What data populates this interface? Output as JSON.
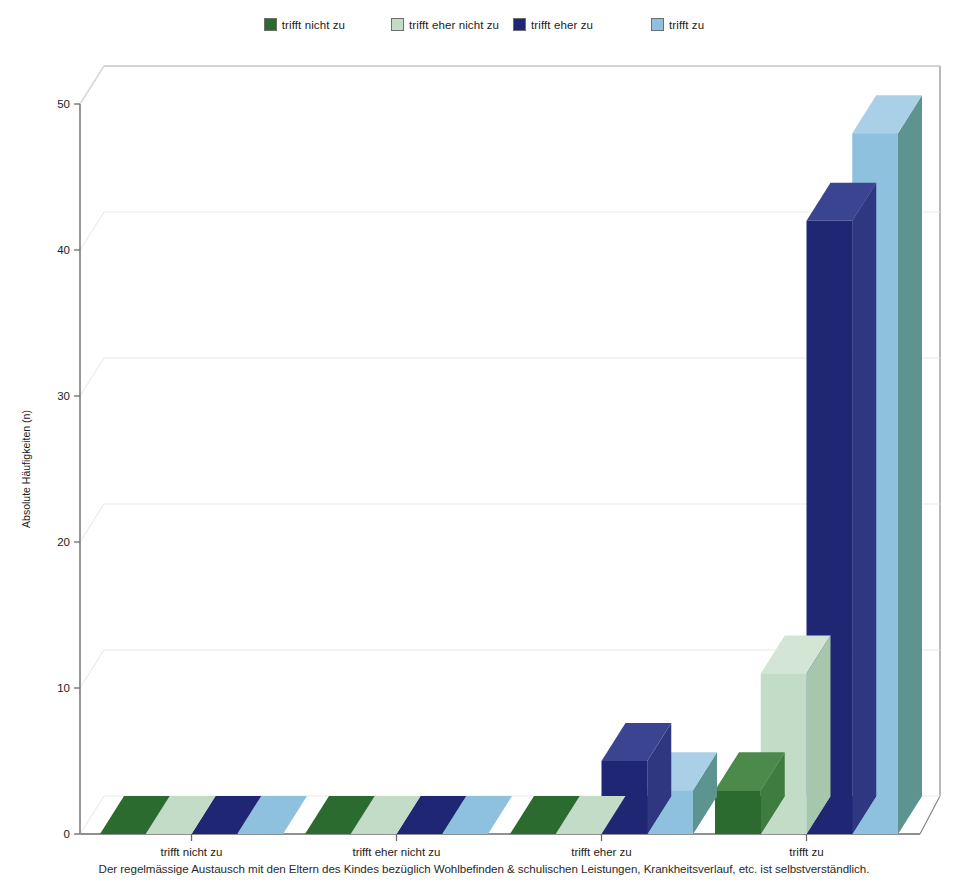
{
  "legend": {
    "items": [
      {
        "label": "trifft nicht zu",
        "color": "#2c6b2f"
      },
      {
        "label": "trifft eher nicht zu",
        "color": "#c3dcc7"
      },
      {
        "label": "trifft eher zu",
        "color": "#1f2673"
      },
      {
        "label": "trifft zu",
        "color": "#8ec1de"
      }
    ]
  },
  "axes": {
    "y_label": "Absolute Häufigkeiten (n)",
    "y_ticks": [
      "0",
      "10",
      "20",
      "30",
      "40",
      "50"
    ]
  },
  "caption": "Der regelmässige Austausch mit den Eltern des Kindes bezüglich Wohlbefinden & schulischen Leistungen, Krankheitsverlauf, etc. ist selbstverständlich.",
  "chart_data": {
    "type": "bar",
    "title": "",
    "subtitle": "",
    "xlabel": "",
    "ylabel": "Absolute Häufigkeiten (n)",
    "ylim": [
      0,
      50
    ],
    "yticks": [
      0,
      10,
      20,
      30,
      40,
      50
    ],
    "grid": true,
    "three_d": true,
    "legend_position": "top-center",
    "categories": [
      "trifft nicht zu",
      "trifft eher nicht zu",
      "trifft eher zu",
      "trifft zu"
    ],
    "series": [
      {
        "name": "trifft nicht zu",
        "color": "#2c6b2f",
        "side_color": "#3e7c3f",
        "top_color": "#4c8a4b",
        "values": [
          0,
          0,
          0,
          3
        ]
      },
      {
        "name": "trifft eher nicht zu",
        "color": "#c3dcc7",
        "side_color": "#a6c7ab",
        "top_color": "#d3e6d6",
        "values": [
          0,
          0,
          0,
          11
        ]
      },
      {
        "name": "trifft eher zu",
        "color": "#1f2673",
        "side_color": "#2f3780",
        "top_color": "#3b4490",
        "values": [
          0,
          0,
          5,
          42
        ]
      },
      {
        "name": "trifft zu",
        "color": "#8ec1de",
        "side_color": "#5d9490",
        "top_color": "#a9d0e6",
        "values": [
          0,
          0,
          3,
          48
        ]
      }
    ],
    "annotations": [
      "Der regelmässige Austausch mit den Eltern des Kindes bezüglich Wohlbefinden & schulischen Leistungen, Krankheitsverlauf, etc. ist selbstverständlich."
    ]
  }
}
